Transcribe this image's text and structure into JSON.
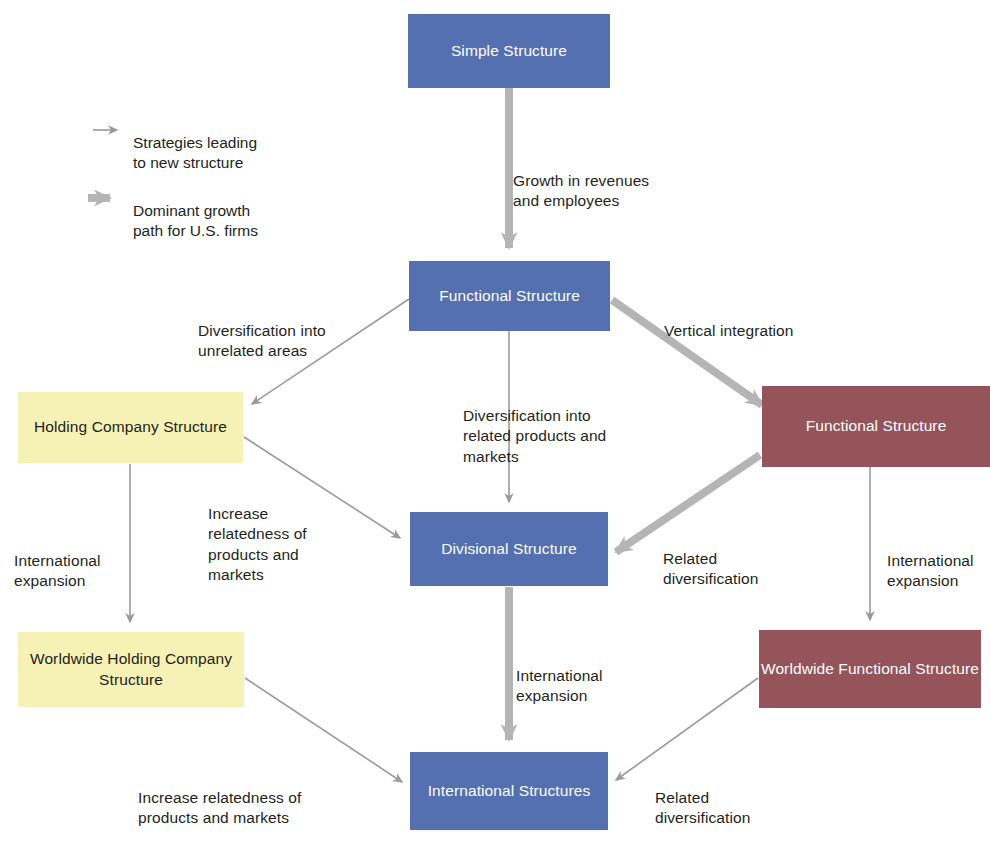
{
  "diagram": {
    "colors": {
      "blue": "#5470B0",
      "red": "#94545A",
      "yellow": "#F6F1B4",
      "arrow_thin": "#9a9a9a",
      "arrow_thick": "#b5b5b5",
      "text": "#231f20"
    },
    "legend": [
      {
        "key": "thin",
        "label": "Strategies leading\nto new structure"
      },
      {
        "key": "thick",
        "label": "Dominant growth\npath for U.S. firms"
      }
    ],
    "nodes": [
      {
        "id": "simple",
        "label": "Simple\nStructure",
        "color": "blue"
      },
      {
        "id": "functional",
        "label": "Functional\nStructure",
        "color": "blue"
      },
      {
        "id": "holding",
        "label": "Holding Company\nStructure",
        "color": "yellow"
      },
      {
        "id": "functional_vert",
        "label": "Functional\nStructure",
        "color": "red"
      },
      {
        "id": "divisional",
        "label": "Divisional\nStructure",
        "color": "blue"
      },
      {
        "id": "ww_holding",
        "label": "Worldwide Holding\nCompany Structure",
        "color": "yellow"
      },
      {
        "id": "ww_functional",
        "label": "Worldwide Functional\nStructure",
        "color": "red"
      },
      {
        "id": "international",
        "label": "International\nStructures",
        "color": "blue"
      }
    ],
    "edge_labels": [
      {
        "id": "growth",
        "text": "Growth in revenues\nand employees"
      },
      {
        "id": "div_unrelated",
        "text": "Diversification into\nunrelated areas"
      },
      {
        "id": "vertical",
        "text": "Vertical integration"
      },
      {
        "id": "div_related",
        "text": "Diversification into\nrelated products and\nmarkets"
      },
      {
        "id": "increase_rel_mid",
        "text": "Increase\nrelatedness of\nproducts and\nmarkets"
      },
      {
        "id": "related_div_mid",
        "text": "Related\ndiversification"
      },
      {
        "id": "intl_exp_left",
        "text": "International\nexpansion"
      },
      {
        "id": "intl_exp_right",
        "text": "International\nexpansion"
      },
      {
        "id": "intl_exp_center",
        "text": "International\nexpansion"
      },
      {
        "id": "increase_rel_bot",
        "text": "Increase relatedness of\nproducts and markets"
      },
      {
        "id": "related_div_bot",
        "text": "Related\ndiversification"
      }
    ]
  }
}
